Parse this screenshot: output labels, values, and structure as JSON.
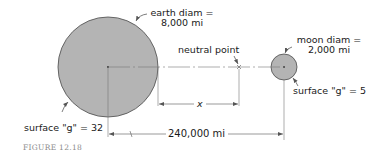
{
  "figure": {
    "caption": "FIGURE 12.18",
    "earth": {
      "diam_label_line1": "earth diam =",
      "diam_label_line2": "8,000 mi",
      "surface_g_label": "surface \"g\" = 32",
      "fill_color": "#b4b4b4",
      "stroke_color": "#4a4a4a"
    },
    "moon": {
      "diam_label_line1": "moon diam =",
      "diam_label_line2": "2,000 mi",
      "surface_g_label": "surface \"g\" = 5",
      "fill_color": "#b4b4b4",
      "stroke_color": "#4a4a4a"
    },
    "neutral_point_label": "neutral point",
    "distance_x_label": "x",
    "distance_total_label": "240,000 mi"
  }
}
